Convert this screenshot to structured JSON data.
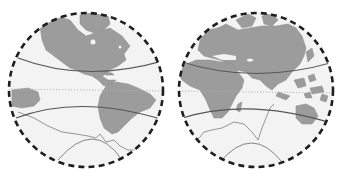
{
  "map": {
    "type": "double-hemisphere world map",
    "hemispheres": [
      {
        "name": "western-hemisphere",
        "continents": [
          "North America",
          "South America",
          "Greenland",
          "Antarctica (partial)"
        ]
      },
      {
        "name": "eastern-hemisphere",
        "continents": [
          "Europe",
          "Africa",
          "Asia",
          "Australia",
          "Maritime Southeast Asia",
          "Antarctica (partial)"
        ]
      }
    ],
    "reference_lines": [
      "tropic-of-cancer",
      "equator",
      "tropic-of-capricorn",
      "antarctic-circle"
    ],
    "colors": {
      "land": "#9c9c9c",
      "ocean": "#f3f3f3",
      "rim": "#1e1e1e",
      "tropic_lines": "#555555",
      "equator": "#b0b0b0"
    }
  }
}
